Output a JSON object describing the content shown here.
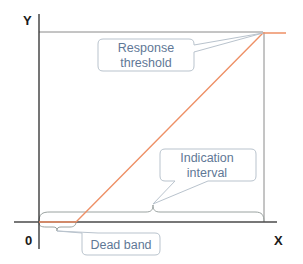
{
  "diagram": {
    "axes": {
      "y_label": "Y",
      "x_label": "X",
      "origin_label": "0"
    },
    "callouts": {
      "response_threshold": [
        "Response",
        "threshold"
      ],
      "indication_interval": [
        "Indication",
        "interval"
      ],
      "dead_band": [
        "Dead band"
      ]
    },
    "colors": {
      "axis": "#2b2b2b",
      "guide": "#8a8a8a",
      "response_curve": "#ee9066",
      "callout_border": "#b9c3cd",
      "callout_text": "#5f7896",
      "brace": "#9aa2a0"
    }
  }
}
